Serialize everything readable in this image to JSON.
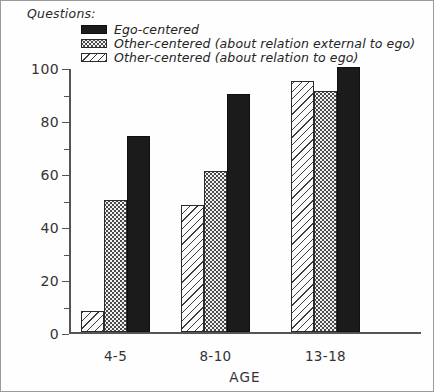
{
  "chart_data": {
    "type": "bar",
    "title": "Questions:",
    "xlabel": "AGE",
    "ylabel": "",
    "ylim": [
      0,
      100
    ],
    "ytick_values": [
      0,
      20,
      40,
      60,
      80,
      100
    ],
    "ytick_labels": [
      "0",
      "20",
      "40",
      "60",
      "80",
      "100"
    ],
    "yminor_values": [
      10,
      30,
      50,
      70,
      90
    ],
    "grid": false,
    "legend_position": "top-left",
    "categories": [
      "4-5",
      "8-10",
      "13-18"
    ],
    "series": [
      {
        "name": "Other-centered (about relation to ego)",
        "fill": "hatch",
        "values": [
          8,
          48,
          95
        ]
      },
      {
        "name": "Other-centered (about relation external to ego)",
        "fill": "dotted",
        "values": [
          50,
          61,
          91
        ]
      },
      {
        "name": "Ego-centered",
        "fill": "solid",
        "values": [
          74,
          90,
          100
        ]
      }
    ],
    "legend_order": [
      {
        "label": "Ego-centered",
        "fill": "solid"
      },
      {
        "label": "Other-centered (about relation external to ego)",
        "fill": "dotted"
      },
      {
        "label": "Other-centered (about relation to ego)",
        "fill": "hatch"
      }
    ]
  },
  "colors": {
    "solid": "#1b1b1b",
    "dotted": "#f2f2f2",
    "hatch": "#fbfbfb",
    "axis": "#555555",
    "frame": "#9a9a9a",
    "text": "#242424"
  }
}
